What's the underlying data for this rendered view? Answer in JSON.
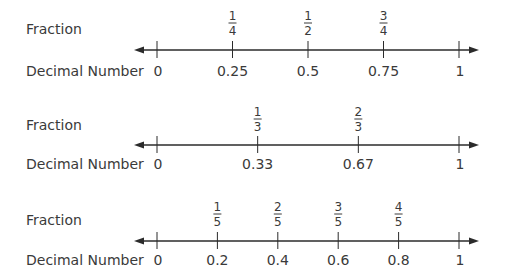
{
  "labels": {
    "fraction": "Fraction",
    "decimal": "Decimal Number"
  },
  "number_lines": [
    {
      "range": [
        0,
        1
      ],
      "end_labels": [
        "0",
        "1"
      ],
      "points": [
        {
          "value": 0.25,
          "numerator": "1",
          "denominator": "4",
          "decimal": "0.25"
        },
        {
          "value": 0.5,
          "numerator": "1",
          "denominator": "2",
          "decimal": "0.5"
        },
        {
          "value": 0.75,
          "numerator": "3",
          "denominator": "4",
          "decimal": "0.75"
        }
      ]
    },
    {
      "range": [
        0,
        1
      ],
      "end_labels": [
        "0",
        "1"
      ],
      "points": [
        {
          "value": 0.3333,
          "numerator": "1",
          "denominator": "3",
          "decimal": "0.33"
        },
        {
          "value": 0.6667,
          "numerator": "2",
          "denominator": "3",
          "decimal": "0.67"
        }
      ]
    },
    {
      "range": [
        0,
        1
      ],
      "end_labels": [
        "0",
        "1"
      ],
      "points": [
        {
          "value": 0.2,
          "numerator": "1",
          "denominator": "5",
          "decimal": "0.2"
        },
        {
          "value": 0.4,
          "numerator": "2",
          "denominator": "5",
          "decimal": "0.4"
        },
        {
          "value": 0.6,
          "numerator": "3",
          "denominator": "5",
          "decimal": "0.6"
        },
        {
          "value": 0.8,
          "numerator": "4",
          "denominator": "5",
          "decimal": "0.8"
        }
      ]
    }
  ],
  "colors": {
    "ink": "#3a3a3a",
    "line": "#2b2b2b"
  }
}
